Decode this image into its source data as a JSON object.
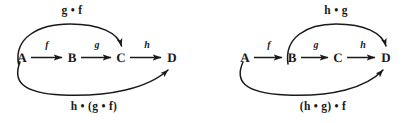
{
  "figure": {
    "background_color": "#ffffff",
    "ink_color": "#1a1a1a"
  },
  "diagrams": [
    {
      "id": "left",
      "nodes": [
        {
          "label": "A",
          "x": 22,
          "y": 57
        },
        {
          "label": "B",
          "x": 72,
          "y": 57
        },
        {
          "label": "C",
          "x": 121,
          "y": 57
        },
        {
          "label": "D",
          "x": 172,
          "y": 57
        }
      ],
      "straight_arrows": [
        {
          "label": "f",
          "from": "A",
          "to": "B",
          "label_x": 47,
          "label_y": 45
        },
        {
          "label": "g",
          "from": "B",
          "to": "C",
          "label_x": 97,
          "label_y": 45
        },
        {
          "label": "h",
          "from": "C",
          "to": "D",
          "label_x": 147,
          "label_y": 45
        }
      ],
      "curved_arrows": [
        {
          "label": "g • f",
          "from": "A",
          "to": "C",
          "side": "top",
          "label_x": 72,
          "label_y": 11
        },
        {
          "label": "h • (g • f)",
          "from": "A",
          "to": "D",
          "side": "bottom",
          "label_x": 94,
          "label_y": 107
        }
      ]
    },
    {
      "id": "right",
      "nodes": [
        {
          "label": "A",
          "x": 37,
          "y": 57
        },
        {
          "label": "B",
          "x": 84,
          "y": 57
        },
        {
          "label": "C",
          "x": 130,
          "y": 57
        },
        {
          "label": "D",
          "x": 178,
          "y": 57
        }
      ],
      "straight_arrows": [
        {
          "label": "f",
          "from": "A",
          "to": "B",
          "label_x": 61,
          "label_y": 45
        },
        {
          "label": "g",
          "from": "B",
          "to": "C",
          "label_x": 108,
          "label_y": 45
        },
        {
          "label": "h",
          "from": "C",
          "to": "D",
          "label_x": 155,
          "label_y": 45
        }
      ],
      "curved_arrows": [
        {
          "label": "h • g",
          "from": "B",
          "to": "D",
          "side": "top",
          "label_x": 128,
          "label_y": 11
        },
        {
          "label": "(h • g) • f",
          "from": "A",
          "to": "D",
          "side": "bottom",
          "label_x": 115,
          "label_y": 107
        }
      ]
    }
  ]
}
